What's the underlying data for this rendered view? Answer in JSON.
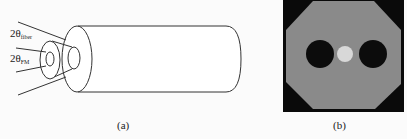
{
  "figure": {
    "panel_a": {
      "caption": "(a)",
      "labels": {
        "theta_fiber_prefix": "2θ",
        "theta_fiber_sub": "fiber",
        "theta_fm_prefix": "2θ",
        "theta_fm_sub": "FM"
      }
    },
    "panel_b": {
      "caption": "(b)",
      "colors": {
        "background": "#0a0a0a",
        "octagon": "#8a8a8a",
        "holes": "#0c0c0c",
        "center_dot": "#d8d8d8"
      }
    }
  }
}
